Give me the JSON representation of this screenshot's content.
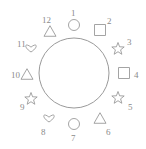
{
  "diagram": {
    "stroke_color": "#9a9a9a",
    "label_color": "#8a8a8a",
    "background_color": "#ffffff",
    "center_circle": {
      "name": "center-circle",
      "cx": 74,
      "cy": 73,
      "r": 35
    },
    "positions": [
      {
        "number": "1",
        "shape": "circle",
        "shape_cx": 74,
        "shape_cy": 25,
        "size": 11,
        "label_x": 71,
        "label_y": 9
      },
      {
        "number": "2",
        "shape": "square",
        "shape_cx": 100,
        "shape_cy": 30,
        "size": 11,
        "label_x": 107,
        "label_y": 17
      },
      {
        "number": "3",
        "shape": "star",
        "shape_cx": 118,
        "shape_cy": 49,
        "size": 13,
        "label_x": 127,
        "label_y": 38
      },
      {
        "number": "4",
        "shape": "square",
        "shape_cx": 124,
        "shape_cy": 73,
        "size": 11,
        "label_x": 134,
        "label_y": 71
      },
      {
        "number": "5",
        "shape": "star",
        "shape_cx": 118,
        "shape_cy": 98,
        "size": 13,
        "label_x": 128,
        "label_y": 103
      },
      {
        "number": "6",
        "shape": "triangle",
        "shape_cx": 100,
        "shape_cy": 118,
        "size": 12,
        "label_x": 106,
        "label_y": 128
      },
      {
        "number": "7",
        "shape": "circle",
        "shape_cx": 74,
        "shape_cy": 124,
        "size": 11,
        "label_x": 71,
        "label_y": 134
      },
      {
        "number": "8",
        "shape": "heart",
        "shape_cx": 49,
        "shape_cy": 118,
        "size": 13,
        "label_x": 41,
        "label_y": 128
      },
      {
        "number": "9",
        "shape": "star",
        "shape_cx": 31,
        "shape_cy": 99,
        "size": 13,
        "label_x": 20,
        "label_y": 103
      },
      {
        "number": "10",
        "shape": "triangle",
        "shape_cx": 27,
        "shape_cy": 74,
        "size": 12,
        "label_x": 11,
        "label_y": 71
      },
      {
        "number": "11",
        "shape": "heart",
        "shape_cx": 31,
        "shape_cy": 48,
        "size": 13,
        "label_x": 17,
        "label_y": 40
      },
      {
        "number": "12",
        "shape": "triangle",
        "shape_cx": 50,
        "shape_cy": 31,
        "size": 12,
        "label_x": 42,
        "label_y": 16
      }
    ]
  }
}
